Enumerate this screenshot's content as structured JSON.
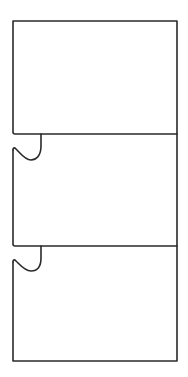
{
  "diagram": {
    "title": "",
    "colors": {
      "background": "#ffffff",
      "stroke": "#2a2a2a"
    },
    "stroke_width": 1.6,
    "panels": [
      {
        "id": "panel-1",
        "label": ""
      },
      {
        "id": "panel-2",
        "label": ""
      },
      {
        "id": "panel-3",
        "label": ""
      }
    ],
    "connectors": [
      {
        "id": "connector-1",
        "between": [
          "panel-1",
          "panel-2"
        ]
      },
      {
        "id": "connector-2",
        "between": [
          "panel-2",
          "panel-3"
        ]
      }
    ]
  }
}
